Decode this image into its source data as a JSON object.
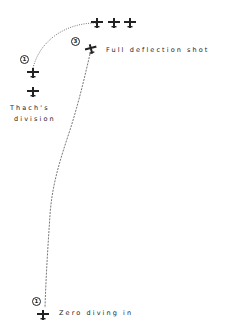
{
  "diagram": {
    "type": "tactical maneuver diagram",
    "labels": {
      "thach_line1": "Thach's",
      "thach_line2": "division",
      "full_deflection": "Full deflection shot",
      "zero_diving": "Zero diving in"
    },
    "position_markers": [
      {
        "id": "thach-pos-1",
        "text": "1"
      },
      {
        "id": "zero-pos-3",
        "text": "3"
      },
      {
        "id": "zero-pos-1",
        "text": "1"
      }
    ],
    "aircraft": [
      {
        "id": "formation-plane-a",
        "icon": "aircraft-icon"
      },
      {
        "id": "formation-plane-b",
        "icon": "aircraft-icon"
      },
      {
        "id": "formation-plane-c",
        "icon": "aircraft-icon"
      },
      {
        "id": "thach-plane-1",
        "icon": "aircraft-icon"
      },
      {
        "id": "thach-plane-2",
        "icon": "aircraft-icon"
      },
      {
        "id": "zero-plane-pos-3",
        "icon": "aircraft-icon"
      },
      {
        "id": "zero-plane-pos-1",
        "icon": "aircraft-icon"
      }
    ],
    "paths": [
      {
        "id": "thach-turn-path",
        "style": "dotted"
      },
      {
        "id": "zero-dive-path",
        "style": "dashed"
      }
    ],
    "colors": {
      "ink": "#222222",
      "path": "#555555",
      "background": "#ffffff"
    }
  }
}
